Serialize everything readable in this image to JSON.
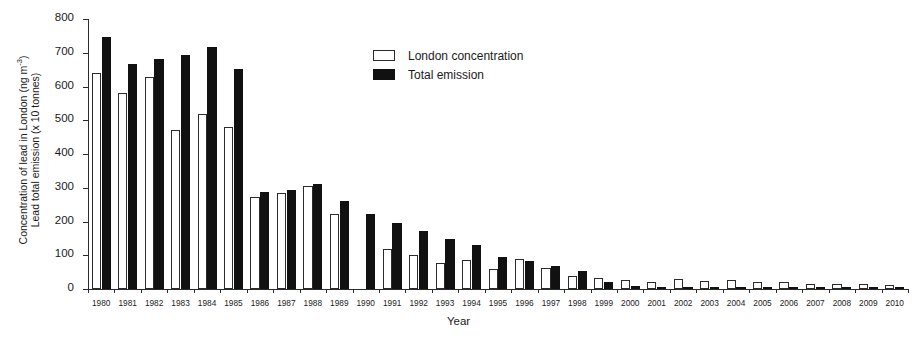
{
  "chart_data": {
    "type": "bar",
    "title": "",
    "xlabel": "Year",
    "ylabel_line1": "Concentration of lead in London (ng m",
    "ylabel_line1_exp": "-3",
    "ylabel_line1_end": ")",
    "ylabel_line2": "Lead total emission (x 10 tonnes)",
    "ylim": [
      0,
      800
    ],
    "yticks": [
      0,
      100,
      200,
      300,
      400,
      500,
      600,
      700,
      800
    ],
    "ytick_labels": [
      "0",
      "100",
      "200",
      "300",
      "400",
      "500",
      "600",
      "700",
      "800"
    ],
    "grid": false,
    "legend_position": "upper-center",
    "categories": [
      "1980",
      "1981",
      "1982",
      "1983",
      "1984",
      "1985",
      "1986",
      "1987",
      "1988",
      "1989",
      "1990",
      "1991",
      "1992",
      "1993",
      "1994",
      "1995",
      "1996",
      "1997",
      "1998",
      "1999",
      "2000",
      "2001",
      "2002",
      "2003",
      "2004",
      "2005",
      "2006",
      "2007",
      "2008",
      "2009",
      "2010"
    ],
    "series": [
      {
        "name": "London concentration",
        "color": "#ffffff",
        "edge_color": "#2b2b2b",
        "values": [
          640,
          580,
          628,
          470,
          520,
          480,
          272,
          285,
          305,
          222,
          0,
          118,
          100,
          78,
          85,
          58,
          88,
          62,
          40,
          32,
          26,
          22,
          30,
          25,
          26,
          22,
          20,
          15,
          16,
          14,
          12
        ]
      },
      {
        "name": "Total emission",
        "color": "#111111",
        "edge_color": "#111111",
        "values": [
          748,
          668,
          682,
          692,
          716,
          652,
          288,
          294,
          310,
          262,
          222,
          195,
          172,
          148,
          130,
          95,
          82,
          68,
          52,
          22,
          8,
          6,
          5,
          4,
          4,
          3,
          3,
          2,
          2,
          2,
          2
        ]
      }
    ]
  },
  "legend": {
    "entries": [
      {
        "label": "London concentration",
        "style": "white"
      },
      {
        "label": "Total emission",
        "style": "black"
      }
    ]
  }
}
